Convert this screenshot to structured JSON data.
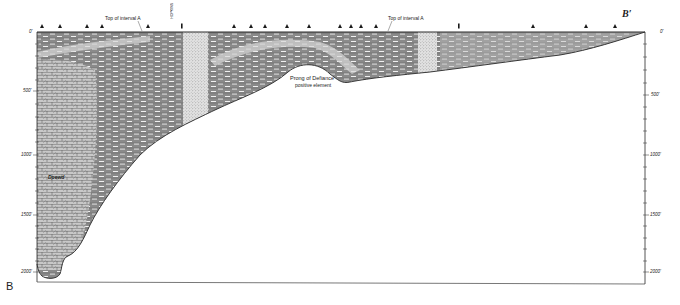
{
  "figure": {
    "type": "geologic cross-section",
    "section_start_label": "B",
    "section_end_label": "B′",
    "annotations": {
      "top_interval_left": "Top of interval A",
      "top_interval_right": "Top of interval A",
      "feature_line1": "Prong of Defiance",
      "feature_line2": "positive element",
      "lithology_note": "Dpewd",
      "vertical_well_label": "HOPKINS"
    },
    "left_axis": {
      "ticks": [
        {
          "label": "0'",
          "y": 32
        },
        {
          "label": "500'",
          "y": 91
        },
        {
          "label": "1000'",
          "y": 155
        },
        {
          "label": "1500'",
          "y": 215
        },
        {
          "label": "2000'",
          "y": 272
        }
      ]
    },
    "right_axis": {
      "ticks": [
        {
          "label": "0'",
          "y": 32
        },
        {
          "label": "500'",
          "y": 95
        },
        {
          "label": "1000'",
          "y": 155
        },
        {
          "label": "1500'",
          "y": 215
        },
        {
          "label": "2000'",
          "y": 272
        }
      ]
    },
    "well_markers_x": [
      42,
      60,
      87,
      102,
      148,
      182,
      234,
      251,
      265,
      287,
      309,
      340,
      351,
      361,
      376,
      459,
      533,
      586,
      615
    ],
    "colors": {
      "ink": "#2a2a2a",
      "shale_fill": "#8d8d8d",
      "limestone_fill": "#bdbdbd",
      "stipple_fill": "#d6d6d6",
      "background": "#ffffff"
    }
  }
}
